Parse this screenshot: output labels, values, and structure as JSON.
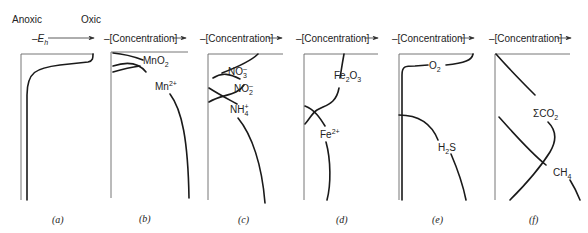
{
  "header": {
    "left_label": "Anoxic",
    "right_label": "Oxic",
    "axis_a": "–E",
    "axis_a_sub": "h",
    "axis_conc": "–[Concentration]"
  },
  "panels": [
    {
      "id": "a",
      "caption": "(a)",
      "x_label": "–E_h",
      "curves": [
        {
          "name": "Eh"
        }
      ]
    },
    {
      "id": "b",
      "caption": "(b)",
      "x_label": "–[Concentration]",
      "curves": [
        {
          "name": "MnO2",
          "label": "MnO",
          "sub": "2"
        },
        {
          "name": "Mn2+",
          "label": "Mn",
          "sup": "2+"
        }
      ]
    },
    {
      "id": "c",
      "caption": "(c)",
      "x_label": "–[Concentration]",
      "curves": [
        {
          "name": "NO3-",
          "label": "NO",
          "sub": "3",
          "sup": "–"
        },
        {
          "name": "NO2-",
          "label": "NO",
          "sub": "2",
          "sup": "–"
        },
        {
          "name": "NH4+",
          "label": "NH",
          "sub": "4",
          "sup": "+"
        }
      ]
    },
    {
      "id": "d",
      "caption": "(d)",
      "x_label": "–[Concentration]",
      "curves": [
        {
          "name": "Fe2O3",
          "label": "Fe",
          "sub1": "2",
          "mid": "O",
          "sub2": "3"
        },
        {
          "name": "Fe2+",
          "label": "Fe",
          "sup": "2+"
        }
      ]
    },
    {
      "id": "e",
      "caption": "(e)",
      "x_label": "–[Concentration]",
      "curves": [
        {
          "name": "O2",
          "label": "O",
          "sub": "2"
        },
        {
          "name": "H2S",
          "label": "H",
          "sub": "2",
          "tail": "S"
        }
      ]
    },
    {
      "id": "f",
      "caption": "(f)",
      "x_label": "–[Concentration]",
      "curves": [
        {
          "name": "SumCO2",
          "label": "ΣCO",
          "sub": "2"
        },
        {
          "name": "CH4",
          "label": "CH",
          "sub": "4"
        }
      ]
    }
  ],
  "captions": [
    "(a)",
    "(b)",
    "(c)",
    "(d)",
    "(e)",
    "(f)"
  ],
  "labels": {
    "mno2": "MnO",
    "mno2_sub": "2",
    "mn2": "Mn",
    "mn2_sup": "2+",
    "no3": "NO",
    "no3_sub": "3",
    "no3_sup": "–",
    "no2": "NO",
    "no2_sub": "2",
    "no2_sup": "–",
    "nh4": "NH",
    "nh4_sub": "4",
    "nh4_sup": "+",
    "fe2o3_a": "Fe",
    "fe2o3_s1": "2",
    "fe2o3_b": "O",
    "fe2o3_s2": "3",
    "fe2": "Fe",
    "fe2_sup": "2+",
    "o2": "O",
    "o2_sub": "2",
    "h2s_a": "H",
    "h2s_sub": "2",
    "h2s_b": "S",
    "sco2": "ΣCO",
    "sco2_sub": "2",
    "ch4": "CH",
    "ch4_sub": "4"
  },
  "colors": {
    "line": "#1a1a1a",
    "frame": "#555555",
    "text": "#222222"
  }
}
